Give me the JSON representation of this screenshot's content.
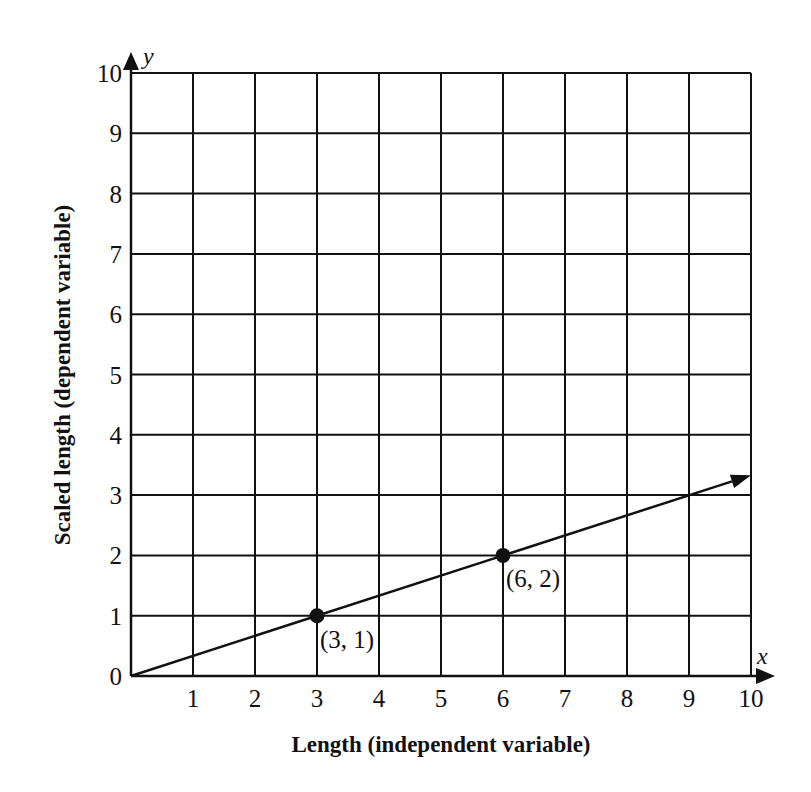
{
  "chart_data": {
    "type": "line",
    "title": "",
    "xlabel": "Length (independent variable)",
    "ylabel": "Scaled length (dependent variable)",
    "x_axis_var": "x",
    "y_axis_var": "y",
    "xlim": [
      0,
      10
    ],
    "ylim": [
      0,
      10
    ],
    "grid": true,
    "x_ticks": [
      "1",
      "2",
      "3",
      "4",
      "5",
      "6",
      "7",
      "8",
      "9",
      "10"
    ],
    "y_ticks": [
      "0",
      "1",
      "2",
      "3",
      "4",
      "5",
      "6",
      "7",
      "8",
      "9",
      "10"
    ],
    "series": [
      {
        "name": "y = x/3",
        "x": [
          0,
          10
        ],
        "y": [
          0,
          3.33
        ],
        "arrow_end": true
      }
    ],
    "points": [
      {
        "x": 3,
        "y": 1,
        "label": "(3, 1)"
      },
      {
        "x": 6,
        "y": 2,
        "label": "(6, 2)"
      }
    ]
  }
}
